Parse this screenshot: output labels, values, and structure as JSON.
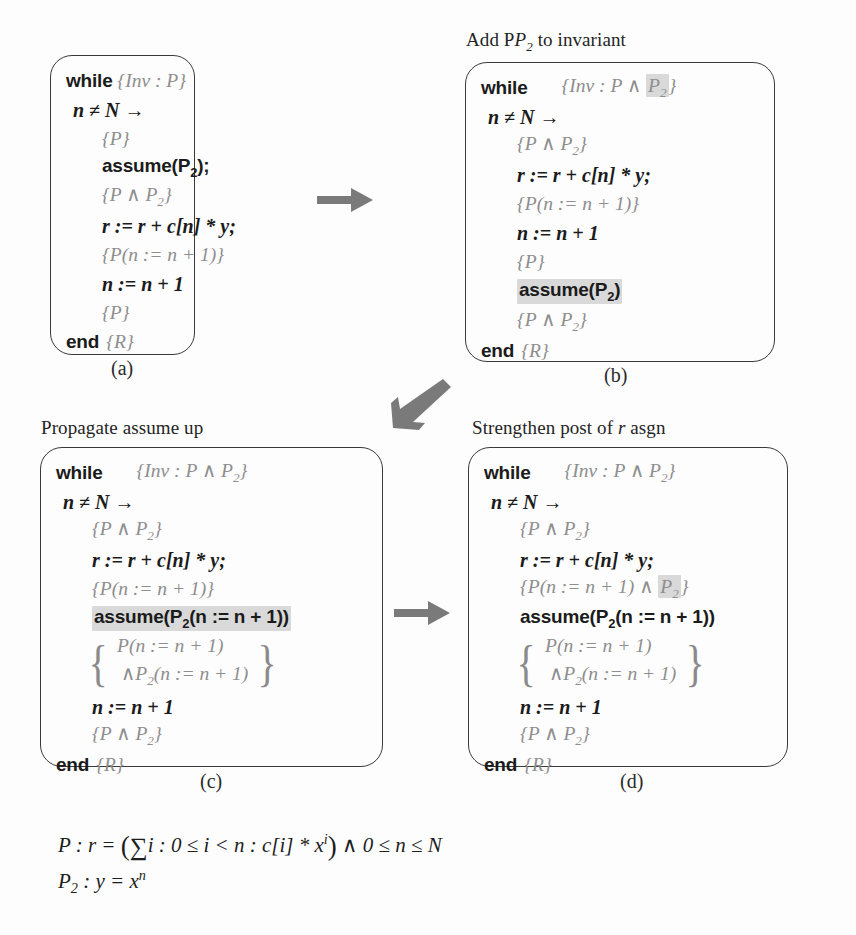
{
  "figure": {
    "background_color": "#fdfdfd",
    "highlight_color": "#d9d9d9",
    "text_color": "#1b1b1b",
    "assertion_color": "#8e8e8e"
  },
  "panels": [
    {
      "id": "a",
      "caption": "",
      "sublabel": "(a)",
      "lines": [
        {
          "kw": "while",
          "assert": "{Inv : P}"
        },
        {
          "stmt": "n ≠ N →"
        },
        {
          "assert": "{P}"
        },
        {
          "stmt_bold": "assume(P₂);"
        },
        {
          "assert": "{P ∧ P₂}"
        },
        {
          "stmt": "r := r + c[n] * y;"
        },
        {
          "assert": "{P(n := n + 1)}"
        },
        {
          "stmt": "n := n + 1"
        },
        {
          "assert": "{P}"
        },
        {
          "kw": "end",
          "assert": "{R}"
        }
      ]
    },
    {
      "id": "b",
      "caption": "Add P₂ to invariant",
      "sublabel": "(b)",
      "lines": [
        {
          "kw": "while",
          "assert_pre": "{Inv : P ∧ ",
          "assert_hl": "P₂",
          "assert_post": "}"
        },
        {
          "stmt": "n ≠ N →"
        },
        {
          "assert": "{P ∧ P₂}"
        },
        {
          "stmt": "r := r + c[n] * y;"
        },
        {
          "assert": "{P(n := n + 1)}"
        },
        {
          "stmt": "n := n + 1"
        },
        {
          "assert": "{P}"
        },
        {
          "stmt_bold_hl": "assume(P₂)"
        },
        {
          "assert": "{P ∧ P₂}"
        },
        {
          "kw": "end",
          "assert": "{R}"
        }
      ]
    },
    {
      "id": "c",
      "caption": "Propagate assume up",
      "sublabel": "(c)",
      "lines": [
        {
          "kw": "while",
          "assert": "{Inv : P ∧ P₂}"
        },
        {
          "stmt": "n ≠ N →"
        },
        {
          "assert": "{P ∧ P₂}"
        },
        {
          "stmt": "r := r + c[n] * y;"
        },
        {
          "assert": "{P(n := n + 1)}"
        },
        {
          "stmt_bold_hl": "assume(P₂(n := n + 1))"
        },
        {
          "braceset": [
            "P(n := n + 1)",
            "∧P₂(n := n + 1)"
          ]
        },
        {
          "stmt": "n := n + 1"
        },
        {
          "assert": "{P ∧ P₂}"
        },
        {
          "kw": "end",
          "assert": "{R}"
        }
      ]
    },
    {
      "id": "d",
      "caption": "Strengthen post of r asgn",
      "sublabel": "(d)",
      "lines": [
        {
          "kw": "while",
          "assert": "{Inv : P ∧ P₂}"
        },
        {
          "stmt": "n ≠ N →"
        },
        {
          "assert": "{P ∧ P₂}"
        },
        {
          "stmt": "r := r + c[n] * y;"
        },
        {
          "assert_pre": "{P(n := n + 1) ∧ ",
          "assert_hl": "P₂",
          "assert_post": "}"
        },
        {
          "stmt_bold": "assume(P₂(n := n + 1))"
        },
        {
          "braceset": [
            "P(n := n + 1)",
            "∧P₂(n := n + 1)"
          ]
        },
        {
          "stmt": "n := n + 1"
        },
        {
          "assert": "{P ∧ P₂}"
        },
        {
          "kw": "end",
          "assert": "{R}"
        }
      ]
    }
  ],
  "panel_a": {
    "l0_kw": "while",
    "l0_assert": "{Inv : P}",
    "l1": "n ≠ N →",
    "l2": "{P}",
    "l3": "assume(P",
    "l3_sub": "2",
    "l3_tail": ");",
    "l4": "{P ∧ P",
    "l4_sub": "2",
    "l4_tail": "}",
    "l5": "r := r + c[n] * y;",
    "l6": "{P(n := n + 1)}",
    "l7": "n := n + 1",
    "l8": "{P}",
    "l9_kw": "end",
    "l9_assert": "{R}",
    "sublabel": "(a)"
  },
  "panel_b": {
    "caption_pre": "Add P",
    "caption_sub": "2",
    "caption_post": " to invariant",
    "l0_kw": "while",
    "l0_assert_pre": "{Inv : P ∧ ",
    "l0_hl": "P",
    "l0_hl_sub": "2",
    "l0_assert_post": "}",
    "l1": "n ≠ N →",
    "l2": "{P ∧ P",
    "l2_sub": "2",
    "l2_tail": "}",
    "l3": "r := r + c[n] * y;",
    "l4": "{P(n := n + 1)}",
    "l5": "n := n + 1",
    "l6": "{P}",
    "l7_hl": "assume(P",
    "l7_hl_sub": "2",
    "l7_hl_tail": ")",
    "l8": "{P ∧ P",
    "l8_sub": "2",
    "l8_tail": "}",
    "l9_kw": "end",
    "l9_assert": "{R}",
    "sublabel": "(b)"
  },
  "panel_c": {
    "caption": "Propagate assume up",
    "l0_kw": "while",
    "l0_assert": "{Inv : P ∧ P",
    "l0_assert_sub": "2",
    "l0_assert_tail": "}",
    "l1": "n ≠ N →",
    "l2": "{P ∧ P",
    "l2_sub": "2",
    "l2_tail": "}",
    "l3": "r := r + c[n] * y;",
    "l4": "{P(n := n + 1)}",
    "l5_hl": "assume(P",
    "l5_hl_sub": "2",
    "l5_hl_tail": "(n := n + 1))",
    "b1": "P(n := n + 1)",
    "b2_pre": "∧P",
    "b2_sub": "2",
    "b2_post": "(n := n + 1)",
    "l7": "n := n + 1",
    "l8": "{P ∧ P",
    "l8_sub": "2",
    "l8_tail": "}",
    "l9_kw": "end",
    "l9_assert": "{R}",
    "sublabel": "(c)"
  },
  "panel_d": {
    "caption_pre": "Strengthen post of ",
    "caption_italic": "r",
    "caption_post": " asgn",
    "l0_kw": "while",
    "l0_assert": "{Inv : P ∧ P",
    "l0_assert_sub": "2",
    "l0_assert_tail": "}",
    "l1": "n ≠ N →",
    "l2": "{P ∧ P",
    "l2_sub": "2",
    "l2_tail": "}",
    "l3": "r := r + c[n] * y;",
    "l4_pre": "{P(n := n + 1) ∧ ",
    "l4_hl": "P",
    "l4_hl_sub": "2",
    "l4_post": "}",
    "l5": "assume(P",
    "l5_sub": "2",
    "l5_tail": "(n := n + 1))",
    "b1": "P(n := n + 1)",
    "b2_pre": "∧P",
    "b2_sub": "2",
    "b2_post": "(n := n + 1)",
    "l7": "n := n + 1",
    "l8": "{P ∧ P",
    "l8_sub": "2",
    "l8_tail": "}",
    "l9_kw": "end",
    "l9_assert": "{R}",
    "sublabel": "(d)"
  },
  "predicates": {
    "p_name": "P",
    "p_body_1": " : r = ",
    "p_sum": "∑",
    "p_body_2": "i : 0 ≤ i < n : c[i] * x",
    "p_exp": "i",
    "p_body_3": " ∧ 0 ≤ n ≤ N",
    "p2_name": "P",
    "p2_sub": "2",
    "p2_body": " : y = x",
    "p2_exp": "n"
  },
  "arrows": {
    "a_to_b": "arrow-right",
    "b_to_c": "arrow-down-left",
    "c_to_d": "arrow-right"
  }
}
